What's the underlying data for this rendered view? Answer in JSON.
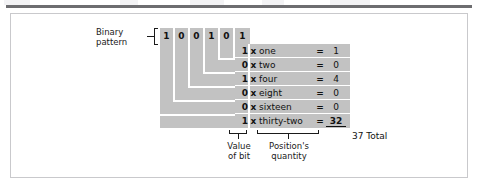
{
  "figure": {
    "binary_pattern_label_line1": "Binary",
    "binary_pattern_label_line2": "pattern",
    "bits": [
      "1",
      "0",
      "0",
      "1",
      "0",
      "1"
    ],
    "times_symbol": "x",
    "equals_symbol": "=",
    "rows": [
      {
        "bit": "1",
        "place_name": "one",
        "result": "1"
      },
      {
        "bit": "0",
        "place_name": "two",
        "result": "0"
      },
      {
        "bit": "1",
        "place_name": "four",
        "result": "4"
      },
      {
        "bit": "0",
        "place_name": "eight",
        "result": "0"
      },
      {
        "bit": "0",
        "place_name": "sixteen",
        "result": "0"
      },
      {
        "bit": "1",
        "place_name": "thirty-two",
        "result": "32"
      }
    ],
    "total_text": "37 Total",
    "bottom_labels": {
      "value_of_bit_line1": "Value",
      "value_of_bit_line2": "of bit",
      "positions_quantity_line1": "Position's",
      "positions_quantity_line2": "quantity"
    },
    "colors": {
      "block_gray": "#c2c2c2",
      "rule_dark": "#6d6d70",
      "frame_border": "#c9c9cc",
      "text": "#111111",
      "background": "#ffffff"
    }
  }
}
